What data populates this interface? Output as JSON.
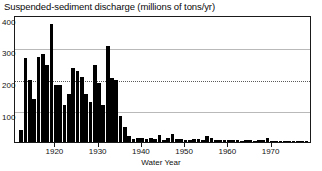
{
  "chart_data": {
    "type": "bar",
    "title": "Suspended-sediment discharge (millions of tons/yr)",
    "xlabel": "Water Year",
    "ylabel": "",
    "ylim": [
      0,
      400
    ],
    "xlim": [
      1911,
      1979
    ],
    "grid": true,
    "legend": null,
    "ytick_labels": [
      "400",
      "300",
      "200",
      "100"
    ],
    "ytick_values": [
      400,
      300,
      200,
      100
    ],
    "xtick_labels": [
      "1920",
      "1930",
      "1940",
      "1950",
      "1960",
      "1970"
    ],
    "xtick_values": [
      1920,
      1930,
      1940,
      1950,
      1960,
      1970
    ],
    "gridline_styles": {
      "400": "none",
      "300": "solid",
      "200": "dotted",
      "100": "solid"
    },
    "bar_color": "#000000",
    "categories": [
      1912,
      1913,
      1914,
      1915,
      1916,
      1917,
      1918,
      1919,
      1920,
      1921,
      1922,
      1923,
      1924,
      1925,
      1926,
      1927,
      1928,
      1929,
      1930,
      1931,
      1932,
      1933,
      1934,
      1935,
      1936,
      1937,
      1938,
      1939,
      1940,
      1941,
      1942,
      1943,
      1944,
      1945,
      1946,
      1947,
      1948,
      1949,
      1950,
      1951,
      1952,
      1953,
      1954,
      1955,
      1956,
      1957,
      1958,
      1959,
      1960,
      1961,
      1962,
      1963,
      1964,
      1965,
      1966,
      1967,
      1968,
      1969,
      1970,
      1971,
      1972,
      1973,
      1974,
      1975,
      1976,
      1977,
      1978
    ],
    "values": [
      40,
      270,
      200,
      140,
      275,
      285,
      250,
      380,
      185,
      185,
      120,
      155,
      240,
      230,
      210,
      155,
      130,
      250,
      190,
      120,
      310,
      205,
      200,
      85,
      50,
      20,
      10,
      14,
      12,
      10,
      12,
      9,
      22,
      8,
      12,
      26,
      10,
      9,
      8,
      7,
      9,
      10,
      8,
      18,
      14,
      8,
      7,
      6,
      7,
      5,
      6,
      4,
      6,
      5,
      4,
      5,
      5,
      12,
      4,
      3,
      3,
      4,
      3,
      3,
      4,
      3,
      4
    ]
  }
}
